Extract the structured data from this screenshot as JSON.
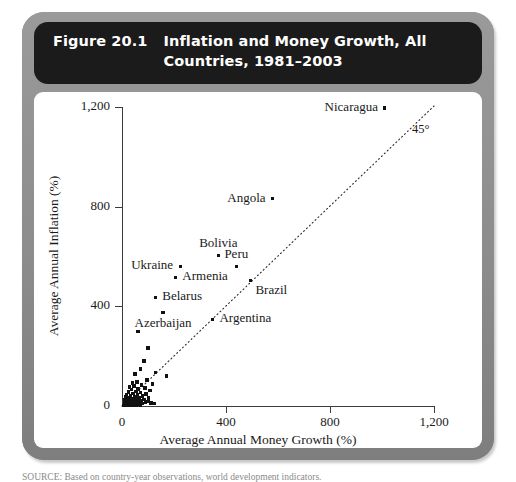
{
  "figure": {
    "number_label": "Figure 20.1",
    "title": "Inflation and Money Growth, All Countries, 1981–2003",
    "source_note": "SOURCE: Based on country-year observations, world development indicators."
  },
  "chart_data": {
    "type": "scatter",
    "title": "Inflation and Money Growth, All Countries, 1981–2003",
    "xlabel": "Average Annual Money Growth (%)",
    "ylabel": "Average Annual Inflation (%)",
    "xlim": [
      0,
      1200
    ],
    "ylim": [
      0,
      1200
    ],
    "xticks": [
      0,
      400,
      800,
      1200
    ],
    "yticks": [
      0,
      400,
      800,
      1200
    ],
    "xtick_labels": [
      "0",
      "400",
      "800",
      "1,200"
    ],
    "ytick_labels": [
      "0",
      "400",
      "800",
      "1,200"
    ],
    "grid": false,
    "legend": false,
    "reference_line": {
      "label": "45°",
      "style": "dotted",
      "slope": 1,
      "intercept": 0
    },
    "labeled_points": [
      {
        "name": "Nicaragua",
        "x": 1010,
        "y": 1196,
        "label_side": "left"
      },
      {
        "name": "Angola",
        "x": 578,
        "y": 832,
        "label_side": "left"
      },
      {
        "name": "Bolivia",
        "x": 370,
        "y": 605,
        "label_side": "above"
      },
      {
        "name": "Ukraine",
        "x": 224,
        "y": 560,
        "label_side": "left"
      },
      {
        "name": "Peru",
        "x": 440,
        "y": 560,
        "label_side": "above"
      },
      {
        "name": "Armenia",
        "x": 205,
        "y": 516,
        "label_side": "right"
      },
      {
        "name": "Belarus",
        "x": 128,
        "y": 436,
        "label_side": "right"
      },
      {
        "name": "Azerbaijan",
        "x": 158,
        "y": 376,
        "label_side": "below"
      },
      {
        "name": "Brazil",
        "x": 494,
        "y": 504,
        "label_side": "below-right"
      },
      {
        "name": "Argentina",
        "x": 348,
        "y": 348,
        "label_side": "right"
      }
    ],
    "unlabeled_points": [
      {
        "x": 62,
        "y": 300
      },
      {
        "x": 100,
        "y": 232
      },
      {
        "x": 84,
        "y": 180
      },
      {
        "x": 70,
        "y": 148
      },
      {
        "x": 128,
        "y": 134
      },
      {
        "x": 50,
        "y": 128
      },
      {
        "x": 170,
        "y": 120
      },
      {
        "x": 96,
        "y": 104
      },
      {
        "x": 58,
        "y": 96
      },
      {
        "x": 40,
        "y": 92
      },
      {
        "x": 118,
        "y": 88
      },
      {
        "x": 76,
        "y": 84
      },
      {
        "x": 46,
        "y": 80
      },
      {
        "x": 30,
        "y": 76
      },
      {
        "x": 88,
        "y": 72
      },
      {
        "x": 62,
        "y": 68
      },
      {
        "x": 36,
        "y": 66
      },
      {
        "x": 108,
        "y": 62
      },
      {
        "x": 54,
        "y": 58
      },
      {
        "x": 24,
        "y": 56
      },
      {
        "x": 72,
        "y": 54
      },
      {
        "x": 42,
        "y": 50
      },
      {
        "x": 92,
        "y": 48
      },
      {
        "x": 18,
        "y": 46
      },
      {
        "x": 60,
        "y": 44
      },
      {
        "x": 32,
        "y": 42
      },
      {
        "x": 78,
        "y": 40
      },
      {
        "x": 48,
        "y": 38
      },
      {
        "x": 14,
        "y": 36
      },
      {
        "x": 66,
        "y": 34
      },
      {
        "x": 26,
        "y": 33
      },
      {
        "x": 102,
        "y": 32
      },
      {
        "x": 38,
        "y": 30
      },
      {
        "x": 56,
        "y": 29
      },
      {
        "x": 20,
        "y": 28
      },
      {
        "x": 84,
        "y": 27
      },
      {
        "x": 44,
        "y": 26
      },
      {
        "x": 12,
        "y": 25
      },
      {
        "x": 64,
        "y": 24
      },
      {
        "x": 30,
        "y": 23
      },
      {
        "x": 50,
        "y": 22
      },
      {
        "x": 16,
        "y": 21
      },
      {
        "x": 74,
        "y": 20
      },
      {
        "x": 36,
        "y": 19
      },
      {
        "x": 24,
        "y": 18
      },
      {
        "x": 58,
        "y": 18
      },
      {
        "x": 10,
        "y": 17
      },
      {
        "x": 42,
        "y": 16
      },
      {
        "x": 90,
        "y": 16
      },
      {
        "x": 28,
        "y": 15
      },
      {
        "x": 68,
        "y": 14
      },
      {
        "x": 18,
        "y": 13
      },
      {
        "x": 48,
        "y": 13
      },
      {
        "x": 34,
        "y": 12
      },
      {
        "x": 112,
        "y": 12
      },
      {
        "x": 22,
        "y": 11
      },
      {
        "x": 60,
        "y": 11
      },
      {
        "x": 40,
        "y": 10
      },
      {
        "x": 14,
        "y": 9
      },
      {
        "x": 80,
        "y": 9
      },
      {
        "x": 30,
        "y": 8
      },
      {
        "x": 52,
        "y": 8
      },
      {
        "x": 20,
        "y": 7
      },
      {
        "x": 38,
        "y": 7
      },
      {
        "x": 10,
        "y": 6
      },
      {
        "x": 64,
        "y": 6
      },
      {
        "x": 26,
        "y": 5
      },
      {
        "x": 44,
        "y": 5
      },
      {
        "x": 16,
        "y": 4
      },
      {
        "x": 34,
        "y": 4
      },
      {
        "x": 56,
        "y": 4
      },
      {
        "x": 8,
        "y": 3
      },
      {
        "x": 22,
        "y": 3
      },
      {
        "x": 46,
        "y": 3
      },
      {
        "x": 12,
        "y": 2
      },
      {
        "x": 30,
        "y": 2
      },
      {
        "x": 70,
        "y": 2
      },
      {
        "x": 18,
        "y": 1
      },
      {
        "x": 40,
        "y": 1
      },
      {
        "x": 100,
        "y": 18
      },
      {
        "x": 124,
        "y": 10
      }
    ]
  }
}
